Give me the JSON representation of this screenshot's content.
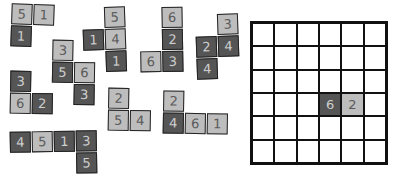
{
  "colors": {
    "light": "#bdbdbd",
    "dark": "#555555",
    "border": "#222222",
    "board_line": "#111111"
  },
  "pieces": [
    {
      "id": "p1",
      "left": 11,
      "top": 4,
      "rotate": 2,
      "tiles": [
        {
          "c": 0,
          "r": 0,
          "v": "5",
          "s": "light"
        },
        {
          "c": 1,
          "r": 0,
          "v": "1",
          "s": "light"
        },
        {
          "c": 0,
          "r": 1,
          "v": "1",
          "s": "dark"
        }
      ]
    },
    {
      "id": "p2",
      "left": 83,
      "top": 7,
      "rotate": -2,
      "tiles": [
        {
          "c": 1,
          "r": 0,
          "v": "5",
          "s": "light"
        },
        {
          "c": 0,
          "r": 1,
          "v": "1",
          "s": "dark"
        },
        {
          "c": 1,
          "r": 1,
          "v": "4",
          "s": "light"
        },
        {
          "c": 1,
          "r": 2,
          "v": "1",
          "s": "dark"
        }
      ]
    },
    {
      "id": "p3",
      "left": 140,
      "top": 7,
      "rotate": -1,
      "tiles": [
        {
          "c": 1,
          "r": 0,
          "v": "6",
          "s": "light"
        },
        {
          "c": 1,
          "r": 1,
          "v": "2",
          "s": "dark"
        },
        {
          "c": 0,
          "r": 2,
          "v": "6",
          "s": "light"
        },
        {
          "c": 1,
          "r": 2,
          "v": "3",
          "s": "dark"
        }
      ]
    },
    {
      "id": "p4",
      "left": 196,
      "top": 14,
      "rotate": -2,
      "tiles": [
        {
          "c": 1,
          "r": 0,
          "v": "3",
          "s": "light"
        },
        {
          "c": 0,
          "r": 1,
          "v": "2",
          "s": "dark"
        },
        {
          "c": 1,
          "r": 1,
          "v": "4",
          "s": "dark"
        },
        {
          "c": 0,
          "r": 2,
          "v": "4",
          "s": "dark"
        }
      ]
    },
    {
      "id": "p5",
      "left": 52,
      "top": 40,
      "rotate": 1,
      "tiles": [
        {
          "c": 0,
          "r": 0,
          "v": "3",
          "s": "light"
        },
        {
          "c": 0,
          "r": 1,
          "v": "5",
          "s": "dark"
        },
        {
          "c": 1,
          "r": 1,
          "v": "6",
          "s": "light"
        },
        {
          "c": 1,
          "r": 2,
          "v": "3",
          "s": "dark"
        }
      ]
    },
    {
      "id": "p6",
      "left": 10,
      "top": 71,
      "rotate": 1,
      "tiles": [
        {
          "c": 0,
          "r": 0,
          "v": "3",
          "s": "dark"
        },
        {
          "c": 0,
          "r": 1,
          "v": "6",
          "s": "light"
        },
        {
          "c": 1,
          "r": 1,
          "v": "2",
          "s": "dark"
        }
      ]
    },
    {
      "id": "p7",
      "left": 108,
      "top": 88,
      "rotate": 1,
      "tiles": [
        {
          "c": 0,
          "r": 0,
          "v": "2",
          "s": "light"
        },
        {
          "c": 0,
          "r": 1,
          "v": "5",
          "s": "light"
        },
        {
          "c": 1,
          "r": 1,
          "v": "4",
          "s": "light"
        }
      ]
    },
    {
      "id": "p8",
      "left": 163,
      "top": 91,
      "rotate": 1,
      "tiles": [
        {
          "c": 0,
          "r": 0,
          "v": "2",
          "s": "light"
        },
        {
          "c": 0,
          "r": 1,
          "v": "4",
          "s": "dark"
        },
        {
          "c": 1,
          "r": 1,
          "v": "6",
          "s": "light"
        },
        {
          "c": 2,
          "r": 1,
          "v": "1",
          "s": "light"
        }
      ]
    },
    {
      "id": "p9",
      "left": 10,
      "top": 131,
      "rotate": -1,
      "tiles": [
        {
          "c": 0,
          "r": 0,
          "v": "4",
          "s": "dark"
        },
        {
          "c": 1,
          "r": 0,
          "v": "5",
          "s": "light"
        },
        {
          "c": 2,
          "r": 0,
          "v": "1",
          "s": "dark"
        },
        {
          "c": 3,
          "r": 0,
          "v": "3",
          "s": "dark"
        },
        {
          "c": 3,
          "r": 1,
          "v": "5",
          "s": "dark"
        }
      ]
    }
  ],
  "board": {
    "rows": 6,
    "cols": 6,
    "filled": [
      {
        "r": 3,
        "c": 3,
        "v": "6",
        "s": "dark"
      },
      {
        "r": 3,
        "c": 4,
        "v": "2",
        "s": "light"
      }
    ]
  }
}
